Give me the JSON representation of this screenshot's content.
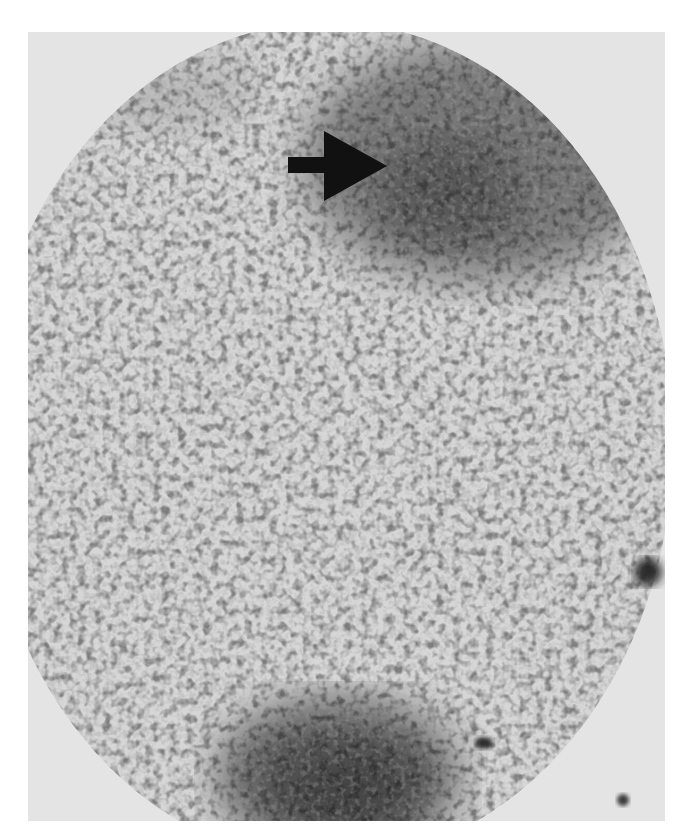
{
  "image": {
    "kind": "grayscale nuclear medicine scintigraphy scan",
    "background_color": "#ffffff",
    "field_base_color": "#c8c8c8",
    "outside_field_color": "#e4e4e4",
    "annotation": {
      "type": "arrow",
      "direction": "right",
      "color": "#111111",
      "points_to": "focal area of increased uptake, upper right"
    },
    "features": [
      {
        "name": "upper-right-uptake-region",
        "description": "broad dark area of increased activity near top right"
      },
      {
        "name": "lower-center-uptake-region",
        "description": "large dark blob at bottom center"
      },
      {
        "name": "right-edge-hot-spot",
        "description": "small dark focal spot at right border"
      },
      {
        "name": "lower-right-small-spot",
        "description": "small dark dot within field, lower right"
      },
      {
        "name": "marker-dot",
        "description": "small dark dot outside field, bottom right corner"
      }
    ]
  }
}
